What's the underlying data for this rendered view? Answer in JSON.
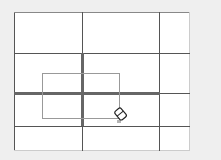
{
  "canvas": {
    "description": "table grid with eraser tool and selection rectangle",
    "columns_x": [
      14,
      82,
      159,
      190
    ],
    "rows_y": [
      12,
      53,
      93,
      126,
      151
    ]
  },
  "selection": {
    "x": 42,
    "y": 73,
    "width": 78,
    "height": 46
  },
  "tool": {
    "name": "eraser-cursor",
    "x": 115,
    "y": 108
  },
  "colors": {
    "background": "#efefef",
    "canvas": "#ffffff",
    "grid_line": "#555555",
    "selection": "#999999"
  }
}
